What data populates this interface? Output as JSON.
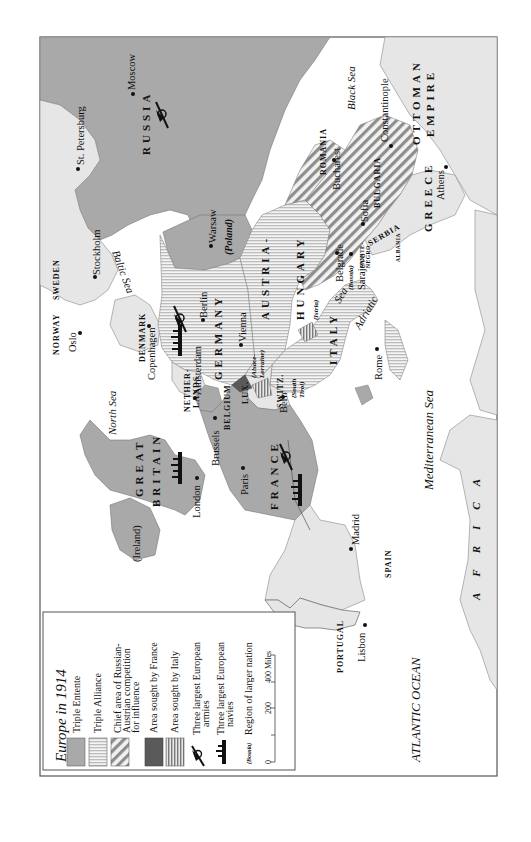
{
  "map": {
    "title": "Europe in 1914",
    "orientation": "rotated 90° counter-clockwise",
    "colors": {
      "triple_entente": "#a9a9a9",
      "triple_alliance_stripe": "#c8c8c8",
      "neutral_land": "#e6e6e6",
      "sea": "#ffffff",
      "area_sought_by_france": "#5a5a5a",
      "frame": "#555555"
    },
    "legend": {
      "title": "Europe in 1914",
      "items": [
        {
          "key": "triple-entente",
          "label": "Triple Entente"
        },
        {
          "key": "triple-alliance",
          "label": "Triple Alliance"
        },
        {
          "key": "russian-austrian",
          "label_lines": [
            "Chief area of Russian-",
            "Austrian competition",
            "for influence"
          ]
        },
        {
          "key": "sought-france",
          "label": "Area sought by France"
        },
        {
          "key": "sought-italy",
          "label": "Area sought by Italy"
        },
        {
          "key": "armies",
          "label_lines": [
            "Three largest European",
            "armies"
          ]
        },
        {
          "key": "navies",
          "label_lines": [
            "Three largest European",
            "navies"
          ]
        },
        {
          "key": "region",
          "sample": "(Bosnia)",
          "label": "Region of larger nation"
        }
      ],
      "scale": {
        "ticks": [
          "0",
          "200",
          "400 Miles"
        ]
      }
    },
    "countries": {
      "russia": "RUSSIA",
      "ottoman_1": "OTTOMAN",
      "ottoman_2": "EMPIRE",
      "romania": "ROMANIA",
      "bulgaria": "BULGARIA",
      "serbia": "SERBIA",
      "greece": "GREECE",
      "montenegro_1": "MONTE-",
      "montenegro_2": "NEGRO",
      "albania": "ALBANIA",
      "austria_1": "AUSTRIA-",
      "austria_2": "HUNGARY",
      "germany": "GERMANY",
      "italy": "ITALY",
      "switz": "SWITZ.",
      "lux": "LUX.",
      "belgium": "BELGIUM",
      "netherlands_1": "NETHER-",
      "netherlands_2": "LANDS",
      "denmark": "DENMARK",
      "norway": "NORWAY",
      "sweden": "SWEDEN",
      "gb_1": "GREAT",
      "gb_2": "BRITAIN",
      "france": "FRANCE",
      "spain": "SPAIN",
      "portugal": "PORTUGAL",
      "africa": "AFRICA"
    },
    "cities": {
      "moscow": "Moscow",
      "st_petersburg": "St. Petersburg",
      "stockholm": "Stockholm",
      "warsaw": "Warsaw",
      "oslo": "Oslo",
      "copenhagen": "Copenhagen",
      "berlin": "Berlin",
      "vienna": "Vienna",
      "amsterdam": "Amsterdam",
      "brussels": "Brussels",
      "london": "London",
      "paris": "Paris",
      "bern": "Bern",
      "rome": "Rome",
      "belgrade": "Belgrade",
      "sarajevo": "Sarajevo",
      "sofia": "Sofia",
      "bucharest": "Bucharest",
      "constantinople": "Constantinople",
      "athens": "Athens",
      "madrid": "Madrid",
      "lisbon": "Lisbon"
    },
    "regions": {
      "poland": "(Poland)",
      "alsace_1": "(Alsace-",
      "alsace_2": "Lorraine)",
      "south_tirol_1": "(South",
      "south_tirol_2": "Tirol)",
      "istria": "(Istria)",
      "bosnia": "(Bosnia)",
      "ireland": "(Ireland)"
    },
    "seas": {
      "black": "Black Sea",
      "baltic": "Baltic Sea",
      "north": "North Sea",
      "adriatic": "Adriatic",
      "adriatic_sea": "Sea",
      "mediterranean": "Mediterranean Sea",
      "atlantic": "ATLANTIC OCEAN"
    }
  }
}
